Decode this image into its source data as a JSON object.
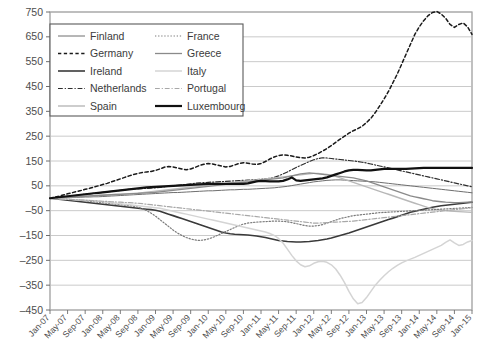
{
  "chart_data": {
    "type": "line",
    "title": "",
    "subtitle": "",
    "xlabel": "",
    "ylabel": "",
    "grid": true,
    "legend_position": "top-left",
    "ylim": [
      -450,
      750
    ],
    "ytick_step": 100,
    "ytick_labels": [
      "750",
      "650",
      "550",
      "450",
      "350",
      "250",
      "150",
      "50",
      "–50",
      "–150",
      "–250",
      "–350",
      "–450"
    ],
    "ytick_values": [
      750,
      650,
      550,
      450,
      350,
      250,
      150,
      50,
      -50,
      -150,
      -250,
      -350,
      -450
    ],
    "xtick_labels": [
      "Jan-07",
      "May-07",
      "Sep-07",
      "Jan-08",
      "May-08",
      "Sep-08",
      "Jan-09",
      "May-09",
      "Sep-09",
      "Jan-10",
      "May-10",
      "Sep-10",
      "Jan-11",
      "May-11",
      "Sep-11",
      "Jan-12",
      "May-12",
      "Sep-12",
      "Jan-13",
      "May-13",
      "Sep-13",
      "Jan-14",
      "May-14",
      "Sep-14",
      "Jan-15"
    ],
    "x_start": "Jan-07",
    "x_end": "Jan-15",
    "x_months": 97,
    "series": [
      {
        "name": "Finland",
        "color": "#6e6e6e",
        "style": "solid",
        "width": 1.0,
        "values": [
          0,
          1,
          1,
          2,
          2,
          3,
          3,
          4,
          5,
          5,
          6,
          6,
          7,
          8,
          9,
          10,
          11,
          12,
          13,
          14,
          15,
          16,
          17,
          18,
          19,
          20,
          21,
          22,
          23,
          23,
          24,
          25,
          26,
          27,
          28,
          29,
          30,
          30,
          31,
          32,
          33,
          34,
          34,
          35,
          36,
          36,
          37,
          38,
          39,
          40,
          41,
          42,
          44,
          46,
          48,
          51,
          54,
          57,
          60,
          63,
          66,
          68,
          70,
          72,
          73,
          74,
          74,
          73,
          72,
          71,
          70,
          69,
          68,
          67,
          66,
          64,
          62,
          60,
          58,
          56,
          54,
          52,
          50,
          48,
          46,
          44,
          42,
          40,
          38,
          36,
          34,
          32,
          30,
          28,
          26,
          24,
          22
        ]
      },
      {
        "name": "Germany",
        "color": "#1a1a1a",
        "style": "dashed",
        "width": 1.5,
        "values": [
          0,
          4,
          8,
          13,
          18,
          22,
          27,
          31,
          36,
          40,
          45,
          50,
          55,
          60,
          66,
          72,
          78,
          84,
          90,
          96,
          100,
          104,
          106,
          108,
          112,
          118,
          125,
          128,
          126,
          122,
          118,
          115,
          118,
          124,
          132,
          137,
          140,
          138,
          134,
          130,
          126,
          128,
          134,
          140,
          143,
          141,
          138,
          136,
          140,
          148,
          158,
          166,
          172,
          175,
          173,
          170,
          166,
          163,
          162,
          165,
          172,
          180,
          190,
          200,
          212,
          225,
          238,
          250,
          262,
          272,
          280,
          290,
          305,
          322,
          345,
          372,
          400,
          430,
          465,
          500,
          540,
          580,
          620,
          660,
          690,
          715,
          735,
          748,
          752,
          742,
          725,
          700,
          688,
          700,
          706,
          690,
          660
        ]
      },
      {
        "name": "Ireland",
        "color": "#3a3a3a",
        "style": "solid",
        "width": 1.6,
        "values": [
          0,
          -2,
          -4,
          -6,
          -8,
          -10,
          -12,
          -14,
          -16,
          -18,
          -20,
          -22,
          -24,
          -26,
          -28,
          -30,
          -32,
          -34,
          -36,
          -38,
          -40,
          -42,
          -44,
          -46,
          -48,
          -52,
          -58,
          -64,
          -70,
          -76,
          -82,
          -88,
          -94,
          -100,
          -106,
          -112,
          -118,
          -124,
          -130,
          -136,
          -140,
          -143,
          -145,
          -146,
          -147,
          -148,
          -150,
          -152,
          -155,
          -158,
          -162,
          -166,
          -170,
          -172,
          -174,
          -175,
          -176,
          -176,
          -175,
          -174,
          -172,
          -170,
          -167,
          -164,
          -160,
          -155,
          -150,
          -145,
          -140,
          -134,
          -128,
          -122,
          -116,
          -110,
          -104,
          -98,
          -92,
          -86,
          -80,
          -74,
          -68,
          -62,
          -56,
          -52,
          -48,
          -44,
          -40,
          -36,
          -33,
          -30,
          -28,
          -26,
          -24,
          -22,
          -20,
          -18,
          -16
        ]
      },
      {
        "name": "Netherlands",
        "color": "#2e2e2e",
        "style": "dashdot",
        "width": 1.2,
        "values": [
          0,
          2,
          4,
          6,
          8,
          10,
          12,
          14,
          16,
          18,
          20,
          22,
          24,
          26,
          28,
          30,
          32,
          34,
          36,
          37,
          38,
          39,
          40,
          41,
          42,
          44,
          46,
          48,
          50,
          52,
          54,
          56,
          58,
          60,
          62,
          63,
          64,
          65,
          66,
          67,
          68,
          69,
          70,
          71,
          72,
          73,
          74,
          75,
          76,
          78,
          80,
          84,
          90,
          98,
          106,
          115,
          124,
          132,
          140,
          148,
          155,
          160,
          163,
          162,
          160,
          158,
          156,
          154,
          152,
          150,
          148,
          145,
          142,
          138,
          134,
          130,
          126,
          122,
          118,
          114,
          110,
          106,
          102,
          98,
          94,
          90,
          86,
          82,
          78,
          74,
          70,
          66,
          62,
          58,
          54,
          50,
          46
        ]
      },
      {
        "name": "Spain",
        "color": "#b8b8b8",
        "style": "solid",
        "width": 1.4,
        "values": [
          0,
          1,
          2,
          3,
          4,
          5,
          6,
          7,
          8,
          9,
          10,
          11,
          12,
          13,
          14,
          15,
          16,
          17,
          18,
          19,
          20,
          22,
          24,
          26,
          28,
          30,
          32,
          34,
          36,
          38,
          40,
          42,
          44,
          46,
          48,
          50,
          52,
          54,
          56,
          58,
          60,
          62,
          64,
          66,
          68,
          70,
          72,
          74,
          76,
          78,
          80,
          82,
          84,
          86,
          88,
          90,
          92,
          94,
          96,
          98,
          100,
          100,
          98,
          96,
          92,
          88,
          82,
          76,
          70,
          64,
          58,
          52,
          46,
          40,
          34,
          28,
          22,
          16,
          10,
          4,
          -2,
          -8,
          -14,
          -20,
          -26,
          -32,
          -38,
          -42,
          -46,
          -48,
          -50,
          -52,
          -53,
          -54,
          -55,
          -56,
          -57
        ]
      },
      {
        "name": "France",
        "color": "#7a7a7a",
        "style": "dotted",
        "width": 1.2,
        "values": [
          0,
          -1,
          -2,
          -3,
          -4,
          -5,
          -6,
          -8,
          -10,
          -12,
          -14,
          -16,
          -18,
          -20,
          -22,
          -24,
          -26,
          -28,
          -30,
          -32,
          -36,
          -42,
          -50,
          -60,
          -72,
          -86,
          -100,
          -114,
          -128,
          -140,
          -150,
          -158,
          -164,
          -168,
          -170,
          -168,
          -164,
          -158,
          -150,
          -142,
          -134,
          -126,
          -118,
          -110,
          -104,
          -100,
          -98,
          -96,
          -95,
          -94,
          -93,
          -92,
          -92,
          -93,
          -95,
          -98,
          -102,
          -106,
          -110,
          -112,
          -112,
          -110,
          -106,
          -100,
          -94,
          -88,
          -82,
          -78,
          -74,
          -70,
          -68,
          -66,
          -64,
          -62,
          -60,
          -58,
          -57,
          -56,
          -55,
          -54,
          -53,
          -52,
          -51,
          -50,
          -49,
          -48,
          -47,
          -46,
          -45,
          -44,
          -43,
          -42,
          -41,
          -40,
          -39,
          -38,
          -37
        ]
      },
      {
        "name": "Greece",
        "color": "#8a8a8a",
        "style": "solid",
        "width": 1.3,
        "values": [
          0,
          1,
          2,
          3,
          4,
          5,
          6,
          7,
          8,
          9,
          10,
          11,
          12,
          13,
          14,
          15,
          16,
          17,
          18,
          19,
          20,
          21,
          22,
          23,
          24,
          26,
          28,
          30,
          32,
          34,
          36,
          38,
          40,
          42,
          44,
          46,
          48,
          50,
          52,
          54,
          56,
          58,
          60,
          62,
          64,
          66,
          68,
          70,
          72,
          74,
          76,
          78,
          80,
          82,
          86,
          90,
          94,
          98,
          100,
          102,
          100,
          98,
          96,
          94,
          92,
          90,
          88,
          86,
          84,
          82,
          78,
          74,
          70,
          64,
          58,
          52,
          46,
          40,
          34,
          28,
          22,
          16,
          10,
          6,
          2,
          -2,
          -6,
          -10,
          -12,
          -14,
          -16,
          -17,
          -18,
          -18,
          -17,
          -16,
          -15
        ]
      },
      {
        "name": "Italy",
        "color": "#d4d4d4",
        "style": "solid",
        "width": 1.5,
        "values": [
          0,
          -1,
          -2,
          -3,
          -4,
          -5,
          -6,
          -7,
          -8,
          -9,
          -10,
          -12,
          -14,
          -16,
          -18,
          -20,
          -22,
          -24,
          -26,
          -28,
          -30,
          -32,
          -34,
          -36,
          -38,
          -40,
          -44,
          -48,
          -52,
          -56,
          -60,
          -64,
          -68,
          -72,
          -76,
          -80,
          -84,
          -88,
          -92,
          -96,
          -100,
          -104,
          -108,
          -112,
          -116,
          -120,
          -124,
          -128,
          -132,
          -136,
          -142,
          -150,
          -162,
          -180,
          -205,
          -230,
          -252,
          -268,
          -276,
          -272,
          -262,
          -256,
          -254,
          -258,
          -268,
          -285,
          -310,
          -340,
          -375,
          -405,
          -425,
          -420,
          -400,
          -375,
          -350,
          -330,
          -312,
          -296,
          -282,
          -270,
          -260,
          -252,
          -245,
          -238,
          -230,
          -222,
          -214,
          -206,
          -198,
          -190,
          -178,
          -168,
          -180,
          -190,
          -186,
          -176,
          -170
        ]
      },
      {
        "name": "Portugal",
        "color": "#a8a8a8",
        "style": "dashdot",
        "width": 1.2,
        "values": [
          0,
          -1,
          -2,
          -3,
          -4,
          -5,
          -6,
          -7,
          -8,
          -9,
          -10,
          -11,
          -12,
          -13,
          -14,
          -15,
          -16,
          -17,
          -18,
          -19,
          -20,
          -22,
          -24,
          -26,
          -28,
          -30,
          -32,
          -34,
          -36,
          -38,
          -40,
          -42,
          -44,
          -46,
          -48,
          -50,
          -52,
          -54,
          -56,
          -58,
          -60,
          -62,
          -64,
          -66,
          -68,
          -70,
          -72,
          -74,
          -76,
          -78,
          -80,
          -82,
          -84,
          -86,
          -88,
          -90,
          -92,
          -94,
          -96,
          -98,
          -100,
          -100,
          -99,
          -98,
          -97,
          -96,
          -95,
          -94,
          -93,
          -92,
          -90,
          -88,
          -86,
          -84,
          -82,
          -80,
          -78,
          -76,
          -74,
          -72,
          -70,
          -68,
          -66,
          -64,
          -62,
          -60,
          -58,
          -56,
          -54,
          -52,
          -50,
          -48,
          -46,
          -44,
          -42,
          -40,
          -38
        ]
      },
      {
        "name": "Luxembourg",
        "color": "#111111",
        "style": "solid",
        "width": 2.2,
        "values": [
          0,
          2,
          4,
          6,
          8,
          10,
          12,
          14,
          16,
          18,
          20,
          22,
          24,
          26,
          28,
          30,
          32,
          34,
          36,
          38,
          40,
          42,
          44,
          45,
          46,
          47,
          48,
          49,
          50,
          51,
          52,
          53,
          54,
          55,
          56,
          57,
          58,
          58,
          58,
          58,
          58,
          58,
          58,
          58,
          58,
          60,
          64,
          68,
          70,
          69,
          68,
          68,
          68,
          70,
          76,
          84,
          72,
          70,
          72,
          74,
          76,
          78,
          80,
          84,
          90,
          96,
          102,
          108,
          112,
          114,
          114,
          113,
          112,
          112,
          114,
          116,
          118,
          118,
          118,
          118,
          118,
          118,
          119,
          120,
          121,
          122,
          122,
          122,
          122,
          122,
          122,
          122,
          122,
          122,
          122,
          122,
          122
        ]
      }
    ]
  },
  "legend": {
    "items": [
      {
        "label": "Finland"
      },
      {
        "label": "Germany"
      },
      {
        "label": "Ireland"
      },
      {
        "label": "Netherlands"
      },
      {
        "label": "Spain"
      },
      {
        "label": "France"
      },
      {
        "label": "Greece"
      },
      {
        "label": "Italy"
      },
      {
        "label": "Portugal"
      },
      {
        "label": "Luxembourg"
      }
    ]
  }
}
